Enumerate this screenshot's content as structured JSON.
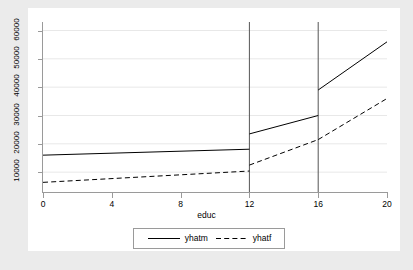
{
  "chart_data": {
    "type": "line",
    "title": "",
    "subtitle": "",
    "xlabel": "educ",
    "ylabel": "",
    "xlim": [
      0,
      20
    ],
    "ylim": [
      3000,
      63000
    ],
    "grid": true,
    "grid_orientation": "horizontal",
    "legend_position": "bottom",
    "xticks": [
      "0",
      "4",
      "8",
      "12",
      "16",
      "20"
    ],
    "xtick_values": [
      0,
      4,
      8,
      12,
      16,
      20
    ],
    "yticks": [
      "10000",
      "20000",
      "30000",
      "40000",
      "50000",
      "60000"
    ],
    "ytick_values": [
      10000,
      20000,
      30000,
      40000,
      50000,
      60000
    ],
    "annotations": [
      {
        "type": "vertical-reference-line",
        "x": 12
      },
      {
        "type": "vertical-reference-line",
        "x": 16
      }
    ],
    "series": [
      {
        "name": "yhatm",
        "style": "solid",
        "color": "#000000",
        "segments": [
          {
            "x": [
              0,
              12
            ],
            "y": [
              16000,
              18100
            ]
          },
          {
            "x": [
              12,
              16
            ],
            "y": [
              23500,
              30000
            ]
          },
          {
            "x": [
              16,
              20
            ],
            "y": [
              39000,
              56000
            ]
          }
        ]
      },
      {
        "name": "yhatf",
        "style": "dashed",
        "color": "#000000",
        "segments": [
          {
            "x": [
              0,
              12
            ],
            "y": [
              6400,
              10400
            ]
          },
          {
            "x": [
              12,
              16
            ],
            "y": [
              12500,
              21500
            ]
          },
          {
            "x": [
              16,
              20
            ],
            "y": [
              21500,
              36000
            ]
          }
        ]
      }
    ]
  },
  "legend": {
    "entries": [
      {
        "label": "yhatm",
        "style": "solid"
      },
      {
        "label": "yhatf",
        "style": "dashed"
      }
    ]
  },
  "colors": {
    "figure_background": "#ebebeb",
    "plot_background": "#ffffff",
    "axis": "#9a9a9a",
    "gridline": "#e8e8e8",
    "line": "#000000"
  }
}
